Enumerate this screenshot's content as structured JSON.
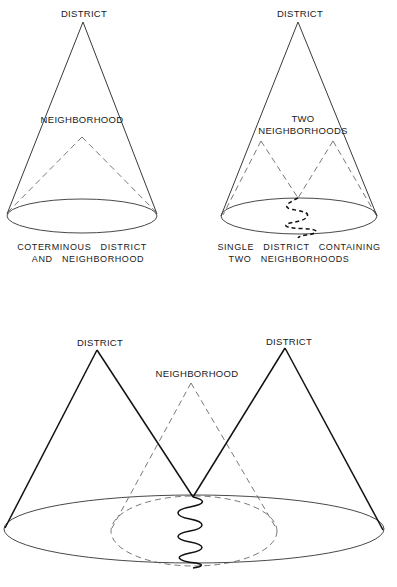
{
  "diagrams": [
    {
      "id": "coterminous",
      "labels": {
        "district": "DISTRICT",
        "neighborhood": "NEIGHBORHOOD"
      },
      "caption": [
        "COTERMINOUS   DISTRICT",
        "AND   NEIGHBORHOOD"
      ]
    },
    {
      "id": "single-district-two-neighborhoods",
      "labels": {
        "district": "DISTRICT",
        "neighborhood_line1": "TWO",
        "neighborhood_line2": "NEIGHBORHOODS"
      },
      "caption": [
        "SINGLE   DISTRICT   CONTAINING",
        "TWO   NEIGHBORHOODS"
      ]
    },
    {
      "id": "neighborhood-across-two-districts",
      "labels": {
        "district_left": "DISTRICT",
        "district_right": "DISTRICT",
        "neighborhood": "NEIGHBORHOOD"
      },
      "caption": []
    }
  ],
  "style": {
    "line_color": "#222222",
    "dash_color": "#555555",
    "background": "#ffffff"
  }
}
